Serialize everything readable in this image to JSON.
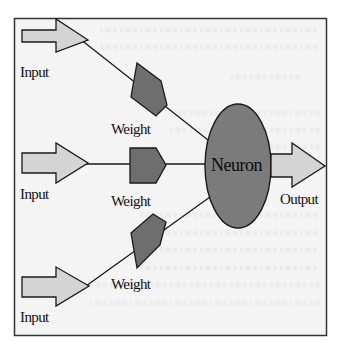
{
  "diagram": {
    "type": "perceptron-neuron",
    "labels": {
      "inputs": [
        "Input",
        "Input",
        "Input"
      ],
      "weights": [
        "Weight",
        "Weight",
        "Weight"
      ],
      "neuron": "Neuron",
      "output": "Output"
    },
    "colors": {
      "frame_background": "#f4f4f4",
      "frame_border": "#333333",
      "arrow_fill": "#d4d4d4",
      "weight_fill": "#6e6e6e",
      "neuron_fill": "#7b7b7b",
      "stroke": "#1a1a1a"
    }
  }
}
